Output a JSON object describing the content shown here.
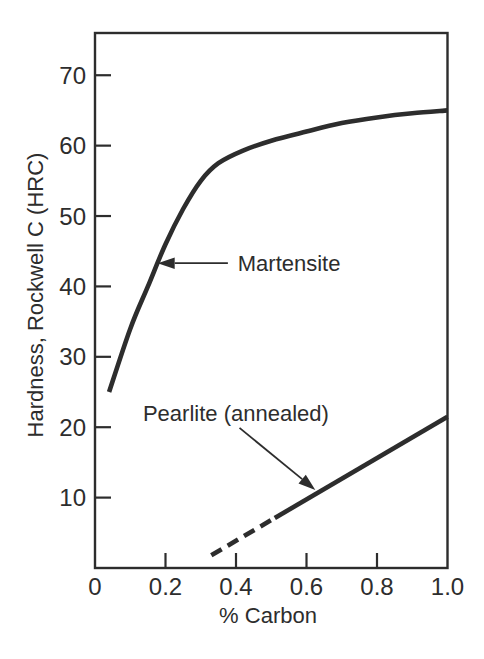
{
  "figure": {
    "background": "#ffffff",
    "ink_color": "#2d2d2d"
  },
  "chart_data": {
    "type": "line",
    "title": "",
    "xlabel": "% Carbon",
    "ylabel": "Hardness, Rockwell C (HRC)",
    "xlim": [
      0,
      1.0
    ],
    "ylim": [
      0,
      76
    ],
    "grid": false,
    "legend": "none (inline arrow annotations)",
    "x_ticks": [
      {
        "value": 0,
        "label": "0",
        "mark": false
      },
      {
        "value": 0.2,
        "label": "0.2",
        "mark": true
      },
      {
        "value": 0.4,
        "label": "0.4",
        "mark": true
      },
      {
        "value": 0.6,
        "label": "0.6",
        "mark": true
      },
      {
        "value": 0.8,
        "label": "0.8",
        "mark": true
      },
      {
        "value": 1.0,
        "label": "1.0",
        "mark": false
      }
    ],
    "y_ticks": [
      {
        "value": 10,
        "label": "10"
      },
      {
        "value": 20,
        "label": "20"
      },
      {
        "value": 30,
        "label": "30"
      },
      {
        "value": 40,
        "label": "40"
      },
      {
        "value": 50,
        "label": "50"
      },
      {
        "value": 60,
        "label": "60"
      },
      {
        "value": 70,
        "label": "70"
      }
    ],
    "series": [
      {
        "name": "Martensite",
        "style": "solid",
        "smooth": true,
        "stroke_width": 4.6,
        "points": [
          [
            0.04,
            25
          ],
          [
            0.1,
            34
          ],
          [
            0.15,
            40
          ],
          [
            0.2,
            46
          ],
          [
            0.25,
            51
          ],
          [
            0.3,
            55
          ],
          [
            0.35,
            57.5
          ],
          [
            0.42,
            59.3
          ],
          [
            0.5,
            60.7
          ],
          [
            0.6,
            62
          ],
          [
            0.7,
            63.2
          ],
          [
            0.8,
            64
          ],
          [
            0.9,
            64.6
          ],
          [
            1.0,
            65
          ]
        ]
      },
      {
        "name": "Pearlite (annealed) - extrapolated segment",
        "style": "dashed",
        "smooth": false,
        "stroke_width": 4.6,
        "points": [
          [
            0.33,
            1.8
          ],
          [
            0.51,
            7.1
          ]
        ]
      },
      {
        "name": "Pearlite (annealed)",
        "style": "solid",
        "smooth": false,
        "stroke_width": 4.6,
        "points": [
          [
            0.51,
            7.1
          ],
          [
            1.0,
            21.5
          ]
        ]
      }
    ],
    "annotations": [
      {
        "id": "martensite-label",
        "text": "Martensite",
        "text_x": 0.405,
        "text_y": 43.3,
        "anchor": "start",
        "arrow_from": [
          0.377,
          43.3
        ],
        "arrow_to": [
          0.178,
          43.3
        ]
      },
      {
        "id": "pearlite-label",
        "text": "Pearlite (annealed)",
        "text_x": 0.136,
        "text_y": 22.0,
        "anchor": "start",
        "arrow_from": [
          0.41,
          19.9
        ],
        "arrow_to": [
          0.625,
          11.1
        ]
      }
    ]
  }
}
